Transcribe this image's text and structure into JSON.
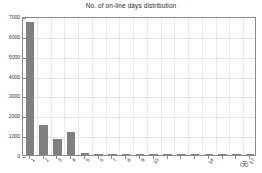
{
  "chart_data": {
    "type": "bar",
    "title": "No. of on-line days distribution",
    "xlabel": "(天)",
    "ylabel": "",
    "categories": [
      "1",
      "2",
      "3",
      "4",
      "5",
      "6",
      "7",
      "8",
      "9",
      "10",
      "11",
      "12",
      "13",
      "14",
      "15",
      "16",
      "17"
    ],
    "tick_labels": [
      "1",
      "2",
      "3",
      "4",
      "5",
      "6",
      "7",
      "8",
      "9",
      "10",
      "14",
      "17"
    ],
    "values": [
      6700,
      1500,
      800,
      1150,
      100,
      20,
      10,
      8,
      6,
      5,
      4,
      3,
      3,
      2,
      2,
      2,
      2
    ],
    "ylim": [
      0,
      7000
    ],
    "yticks": [
      0,
      1000,
      2000,
      3000,
      4000,
      5000,
      6000,
      7000
    ],
    "ytick_labels": [
      "0",
      "1000",
      "2000",
      "3000",
      "4000",
      "5000",
      "6000",
      "7000"
    ],
    "grid": true,
    "legend": null,
    "bar_color": "#808080",
    "grid_color": "#e4e4e4",
    "axis_color": "#8a8a8a",
    "background": "#ffffff"
  }
}
